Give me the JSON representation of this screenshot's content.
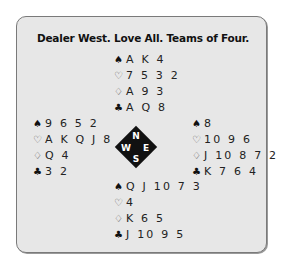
{
  "title": "Dealer West. Love All. Teams of Four.",
  "suit_icons": {
    "spades": "♠",
    "hearts": "♡",
    "diamonds": "♢",
    "clubs": "♣"
  },
  "hands": {
    "north": {
      "spades": "A K 4",
      "hearts": "7 5 3 2",
      "diamonds": "A 9 3",
      "clubs": "A Q 8"
    },
    "west": {
      "spades": "9 6 5 2",
      "hearts": "A K Q J 8",
      "diamonds": "Q 4",
      "clubs": "3 2"
    },
    "east": {
      "spades": "8",
      "hearts": "10 9 6",
      "diamonds": "J 10 8 7 2",
      "clubs": "K 7 6 4"
    },
    "south": {
      "spades": "Q J 10 7 3",
      "hearts": "4",
      "diamonds": "K 6 5",
      "clubs": "J 10 9 5"
    }
  },
  "compass": {
    "north": "N",
    "south": "S",
    "east": "E",
    "west": "W"
  }
}
